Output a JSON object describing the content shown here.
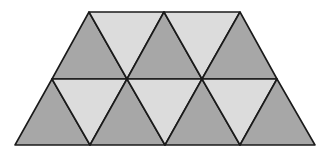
{
  "diagram": {
    "shape": "trapezoid",
    "description": "Trapezoid tiled with equilateral triangles in alternating shades",
    "rows": 2,
    "triangle_count": 12,
    "colors": {
      "dark": "#a7a7a7",
      "light": "#dcdcdc",
      "stroke": "#1a1a1a"
    },
    "triangles": [
      {
        "row": 1,
        "orientation": "up",
        "shade": "dark",
        "points": "89,12 52,79 127,79"
      },
      {
        "row": 1,
        "orientation": "down",
        "shade": "light",
        "points": "89,12 164,12 127,79"
      },
      {
        "row": 1,
        "orientation": "up",
        "shade": "dark",
        "points": "164,12 127,79 202,79"
      },
      {
        "row": 1,
        "orientation": "down",
        "shade": "light",
        "points": "164,12 240,12 202,79"
      },
      {
        "row": 1,
        "orientation": "up",
        "shade": "dark",
        "points": "240,12 202,79 277,79"
      },
      {
        "row": 2,
        "orientation": "up",
        "shade": "dark",
        "points": "52,79 15,145 90,145"
      },
      {
        "row": 2,
        "orientation": "down",
        "shade": "light",
        "points": "52,79 127,79 90,145"
      },
      {
        "row": 2,
        "orientation": "up",
        "shade": "dark",
        "points": "127,79 90,145 165,145"
      },
      {
        "row": 2,
        "orientation": "down",
        "shade": "light",
        "points": "127,79 202,79 165,145"
      },
      {
        "row": 2,
        "orientation": "up",
        "shade": "dark",
        "points": "202,79 165,145 240,145"
      },
      {
        "row": 2,
        "orientation": "down",
        "shade": "light",
        "points": "202,79 277,79 240,145"
      },
      {
        "row": 2,
        "orientation": "up",
        "shade": "dark",
        "points": "277,79 240,145 315,145"
      }
    ]
  }
}
